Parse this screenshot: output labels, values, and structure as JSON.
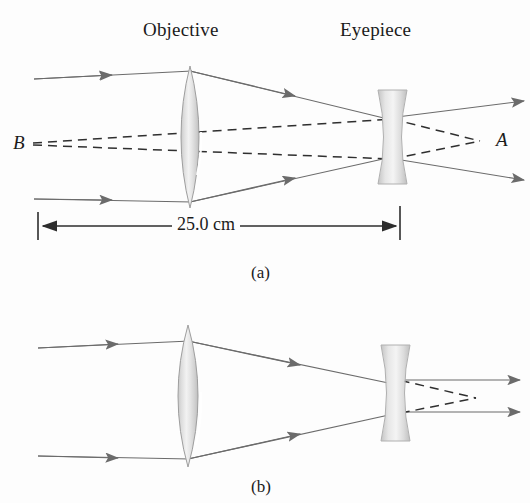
{
  "figure": {
    "background_color": "#fdfdfd",
    "ink_color": "#4a4a4a",
    "text_color": "#1b1b1b",
    "lens_fill_color": "#d8d8d8",
    "lens_edge_color": "#9a9a9a"
  },
  "panel_a": {
    "caption": "(a)",
    "labels": {
      "objective": "Objective",
      "eyepiece": "Eyepiece",
      "object_point": "B",
      "image_point": "A"
    },
    "dimension": {
      "value": "25.0 cm",
      "start_x": 38,
      "end_x": 400
    },
    "components": [
      {
        "name": "objective-lens",
        "type": "biconvex",
        "center_x": 190,
        "center_y": 137,
        "half_height": 71,
        "half_width": 17
      },
      {
        "name": "eyepiece-lens",
        "type": "biconcave",
        "center_x": 392,
        "center_y": 137,
        "half_height": 47,
        "half_width": 15
      }
    ]
  },
  "panel_b": {
    "caption": "(b)",
    "components": [
      {
        "name": "objective-lens",
        "type": "biconvex",
        "center_x": 188,
        "center_y": 396,
        "half_height": 71,
        "half_width": 20
      },
      {
        "name": "eyepiece-lens",
        "type": "biconcave",
        "center_x": 395,
        "center_y": 393,
        "half_height": 48,
        "half_width": 15
      }
    ]
  }
}
